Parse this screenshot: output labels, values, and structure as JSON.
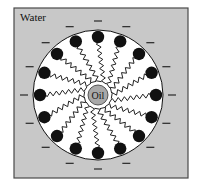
{
  "diagram": {
    "title_label": "Water",
    "core_label": "Oil",
    "colors": {
      "background": "#ffffff",
      "water": "#c8c8c8",
      "border": "#4a4a4a",
      "micelle_fill": "#ffffff",
      "core_fill": "#a8a8a8",
      "head": "#111111",
      "tail": "#222222",
      "charge": "#333333"
    },
    "head_count": 16,
    "charge_symbol": "−"
  }
}
